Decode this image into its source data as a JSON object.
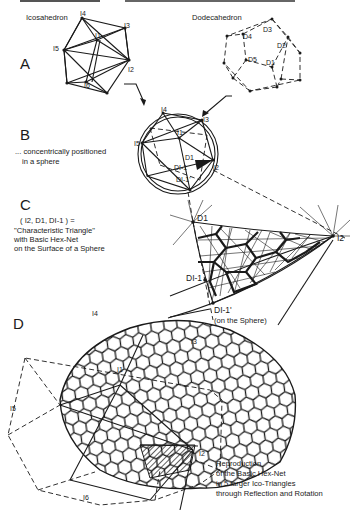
{
  "top_caption_partial": "...Geometry of Icosahedron / Dodecahedron...",
  "panels": {
    "A": {
      "letter": "A",
      "icosahedron": {
        "title": "Icosahedron",
        "vertex_labels": {
          "i4": "I4",
          "i3": "I3",
          "i1": "I1",
          "i5": "I5",
          "i2": "I2",
          "i6": "I6"
        }
      },
      "dodecahedron": {
        "title": "Dodecahedron",
        "vertex_labels": {
          "d3": "D3",
          "d4": "D4",
          "d2": "D2",
          "d5": "D5",
          "d1": "D1"
        }
      }
    },
    "B": {
      "letter": "B",
      "caption_line1": "... concentrically positioned",
      "caption_line2": "in a sphere",
      "vertex_labels": {
        "i4": "I4",
        "i3": "I3",
        "i1": "I1",
        "i5": "I5",
        "i2": "I2",
        "d1": "D1",
        "di1": "DI-1",
        "di1p": "DI-1'"
      }
    },
    "C": {
      "letter": "C",
      "caption_line1": "( I2, D1, DI-1 ) =",
      "caption_line2": "\"Characteristic Triangle\"",
      "caption_line3": "with Basic  Hex-Net",
      "caption_line4": "on the Surface of a Sphere",
      "vertex_labels": {
        "d1": "D1",
        "i2": "I2",
        "di1": "DI-1",
        "di1p": "DI-1'"
      },
      "note": "(on the Sphere)"
    },
    "D": {
      "letter": "D",
      "vertex_labels": {
        "i4": "I4",
        "i3": "I3",
        "i1": "I1",
        "i5": "I5",
        "i2": "I2",
        "i6": "I6"
      },
      "caption_line1": "Reproduction",
      "caption_line2": "of the Basic Hex-Net",
      "caption_line3": "in 5 larger Ico-Triangles",
      "caption_line4": "through Reflection and Rotation"
    }
  }
}
